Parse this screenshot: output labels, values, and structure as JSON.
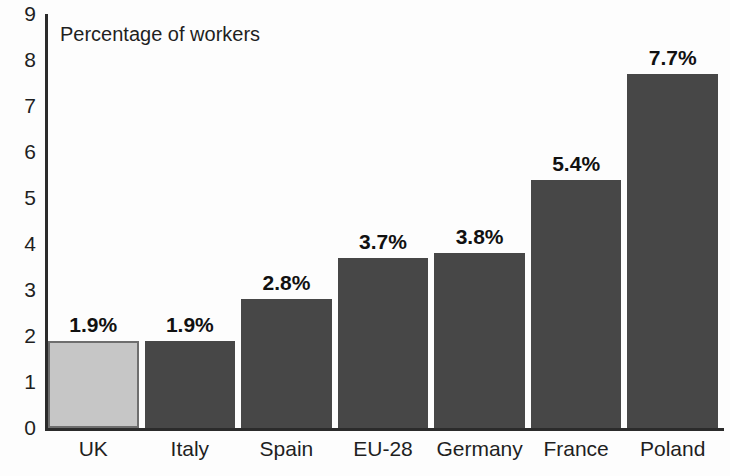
{
  "chart_data": {
    "type": "bar",
    "title": "",
    "ylabel": "Percentage of workers",
    "xlabel": "",
    "ylim": [
      0,
      9
    ],
    "yticks": [
      9,
      8,
      7,
      6,
      5,
      4,
      3,
      2,
      1,
      0
    ],
    "grid": false,
    "legend": "none",
    "categories": [
      "UK",
      "Italy",
      "Spain",
      "EU-28",
      "Germany",
      "France",
      "Poland"
    ],
    "values": [
      1.9,
      1.9,
      2.8,
      3.7,
      3.8,
      5.4,
      7.7
    ],
    "value_labels": [
      "1.9%",
      "1.9%",
      "2.8%",
      "3.7%",
      "3.8%",
      "5.4%",
      "7.7%"
    ],
    "highlight_index": 0,
    "colors": {
      "bar": "#474747",
      "bar_highlight": "#c6c6c6",
      "bar_highlight_border": "#6e6e6e",
      "axis": "#2b2b2b",
      "text": "#1f1f1f",
      "background": "#fdfdfd"
    }
  }
}
